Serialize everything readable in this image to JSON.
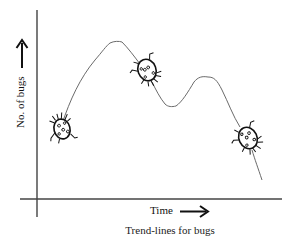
{
  "diagram": {
    "caption": "Trend-lines for bugs",
    "x_axis": {
      "label": "Time",
      "arrow": "right-arrow"
    },
    "y_axis": {
      "label": "No. of bugs",
      "arrow": "up-arrow"
    },
    "curve": {
      "description": "hand-drawn trend line: rises to a peak, dips, rises to a smaller peak, then falls",
      "stroke_color": "#6b6b6b"
    },
    "bugs": [
      {
        "name": "ladybug-icon",
        "position": "start of rise"
      },
      {
        "name": "ladybug-icon",
        "position": "after first peak"
      },
      {
        "name": "ladybug-icon",
        "position": "after second peak"
      }
    ],
    "colors": {
      "axis": "#333333",
      "bug": "#111111",
      "background": "#ffffff"
    }
  }
}
